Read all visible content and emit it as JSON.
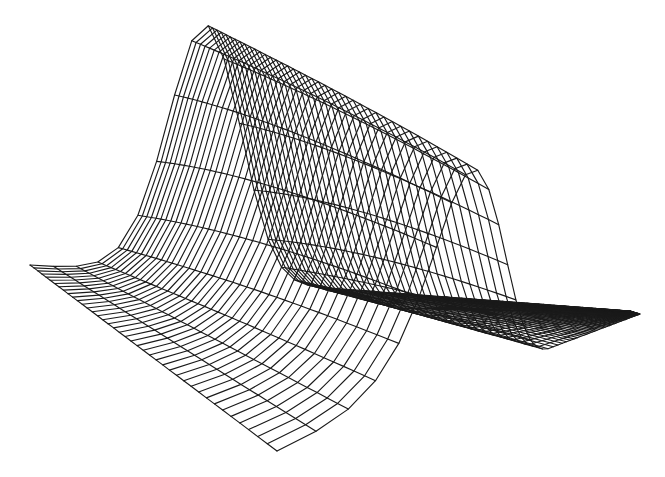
{
  "figure": {
    "width_px": 665,
    "height_px": 477,
    "background_color": "#ffffff",
    "line_color": "#1a1a1a",
    "line_width_px": 1.15,
    "caption": ""
  },
  "chart_data": {
    "type": "surface",
    "title": "",
    "xlabel": "",
    "ylabel": "",
    "zlabel": "",
    "legend": [],
    "axes_visible": false,
    "grid_lines_along_ridge": 41,
    "grid_lines_across_ridge": 66,
    "surface_model": "z(p,q) = A(q) * max(0, (exp(-((p-pr)/sigma(q))^2) - E)/(1-E)), E = exp(-((pr/sigma(q))^2)); ridge (crest) at p = pr, amplitude A grows toward the far end so the far crest end is higher; sigma narrows toward the far end",
    "projection_model": "screen = base(p,q) - vertical * z * L(p,q); base is a perspective-rational blend between the near boundary (near_corner to near_tip) and the far boundary (far_corner to far_tip); rational ease e(t,g) = (1+g)t/(1+gt) supplies the perspective foreshortening that collapses the tail toward the tip",
    "projection": {
      "near_corner": [
        277,
        451
      ],
      "near_tip": [
        640,
        314
      ],
      "far_corner": [
        30,
        265
      ],
      "far_tip": [
        630,
        311
      ],
      "gn": 6.7,
      "gf": 1.631,
      "gy": 0.6,
      "lift_scale": 422,
      "lift_falloff_x": 0.93,
      "lift_falloff_y": 0.28,
      "ridge_p": 0.1384615,
      "sigma_near": 0.45,
      "sigma_far": 0.35,
      "amp_near": 1.0,
      "amp_far": 1.15,
      "cells_across": 65,
      "cells_along": 40
    },
    "landmarks": {
      "crest_far_end_px": [
        208,
        25
      ],
      "crest_near_end_px": [
        478,
        170
      ],
      "far_left_corner_px": [
        30,
        265
      ],
      "near_bottom_corner_px": [
        277,
        451
      ],
      "tail_tip_px": [
        640,
        313
      ]
    }
  }
}
